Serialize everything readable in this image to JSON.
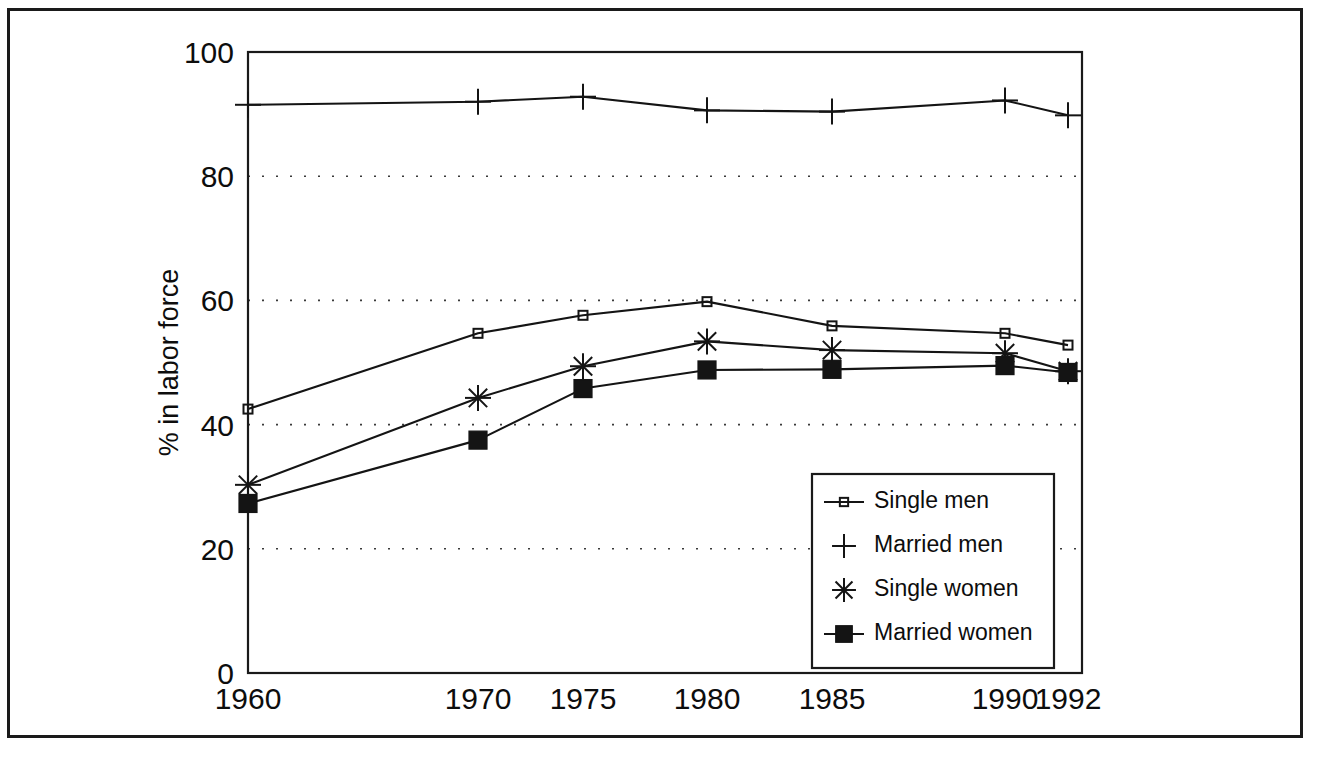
{
  "chart_data": {
    "type": "line",
    "title": "",
    "subtitle": "",
    "xlabel": "",
    "ylabel": "% in labor force",
    "categories": [
      "1960",
      "1970",
      "1975",
      "1980",
      "1985",
      "1990",
      "1992"
    ],
    "x_tick_labels": [
      "1960",
      "1970",
      "1975",
      "1980",
      "1985",
      "1990",
      "1992"
    ],
    "y_tick_labels": [
      "0",
      "20",
      "40",
      "60",
      "80",
      "100"
    ],
    "y_ticks": [
      0,
      20,
      40,
      60,
      80,
      100
    ],
    "ylim": [
      0,
      100
    ],
    "grid": "horizontal-dotted",
    "legend_position": "inside-bottom-right",
    "series": [
      {
        "name": "Single men",
        "marker": "open-circle-small",
        "values": [
          42.5,
          54.7,
          57.6,
          59.8,
          55.9,
          54.7,
          52.8
        ]
      },
      {
        "name": "Married men",
        "marker": "plus",
        "values": [
          91.5,
          92.0,
          92.8,
          90.6,
          90.4,
          92.2,
          89.8
        ]
      },
      {
        "name": "Single women",
        "marker": "asterisk",
        "values": [
          30.3,
          44.3,
          49.4,
          53.4,
          52.0,
          51.5,
          48.6
        ]
      },
      {
        "name": "Married women",
        "marker": "filled-square",
        "values": [
          27.3,
          37.5,
          45.8,
          48.8,
          48.9,
          49.5,
          48.4
        ]
      }
    ]
  },
  "legend": {
    "items": [
      {
        "label": "Single men",
        "marker": "open-circle-small"
      },
      {
        "label": "Married men",
        "marker": "plus"
      },
      {
        "label": "Single women",
        "marker": "asterisk"
      },
      {
        "label": "Married women",
        "marker": "filled-square"
      }
    ]
  },
  "colors": {
    "line": "#141414",
    "frame": "#1a1a1a",
    "grid": "#3a3a3a",
    "background": "#ffffff",
    "text": "#0d0d0d"
  },
  "layout": {
    "plot_left": 248,
    "plot_right": 1082,
    "plot_top": 52,
    "plot_bottom": 673,
    "x_positions": [
      248,
      478,
      583,
      707,
      832,
      1005,
      1068
    ],
    "legend_box": {
      "x": 812,
      "y": 474,
      "width": 242,
      "height": 194
    }
  }
}
